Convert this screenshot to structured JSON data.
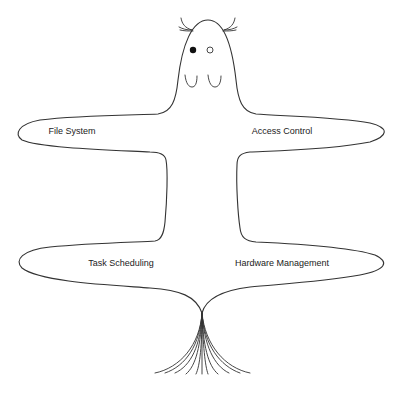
{
  "diagram": {
    "type": "creature-shaped concept diagram",
    "stroke_color": "#333333",
    "background": "#ffffff",
    "labels": [
      {
        "id": "file-system",
        "text": "File System",
        "x": 72,
        "y": 131
      },
      {
        "id": "access-control",
        "text": "Access Control",
        "x": 282,
        "y": 131
      },
      {
        "id": "task-scheduling",
        "text": "Task Scheduling",
        "x": 121,
        "y": 263
      },
      {
        "id": "hardware-management",
        "text": "Hardware Management",
        "x": 282,
        "y": 263
      }
    ],
    "parts": {
      "head": "rounded head with two whisker-like ears",
      "eyes": [
        "filled",
        "hollow"
      ],
      "cheeks": 2,
      "upper_arms": [
        "File System",
        "Access Control"
      ],
      "lower_arms": [
        "Task Scheduling",
        "Hardware Management"
      ],
      "tail": "fanned strands"
    }
  }
}
